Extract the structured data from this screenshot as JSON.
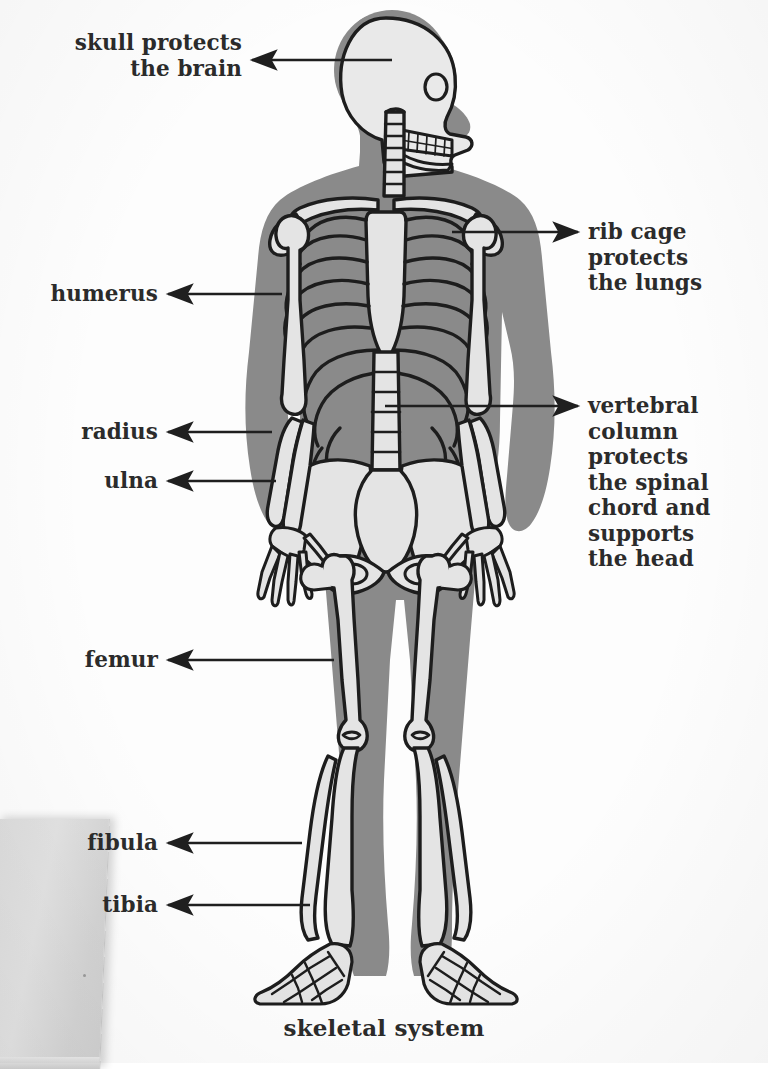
{
  "caption": "skeletal system",
  "colors": {
    "body_silhouette": "#8a8a8a",
    "bone_fill": "#dcdcdc",
    "bone_fill_light": "#e9e9e9",
    "outline": "#1d1d1d",
    "text": "#2b2b2b",
    "page_background": "#fdfdfd",
    "book_edge": "#dcdcdc"
  },
  "diagram": {
    "title": "skeletal system",
    "labels": [
      {
        "id": "skull",
        "text": "skull protects\nthe brain",
        "side": "left",
        "lines": 2,
        "arrow_from_x": 392,
        "arrow_from_y": 60,
        "arrow_to_x": 252,
        "arrow_to_y": 60
      },
      {
        "id": "humerus",
        "text": "humerus",
        "side": "left",
        "lines": 1,
        "arrow_from_x": 282,
        "arrow_from_y": 294,
        "arrow_to_x": 168,
        "arrow_to_y": 294
      },
      {
        "id": "radius",
        "text": "radius",
        "side": "left",
        "lines": 1,
        "arrow_from_x": 272,
        "arrow_from_y": 432,
        "arrow_to_x": 168,
        "arrow_to_y": 432
      },
      {
        "id": "ulna",
        "text": "ulna",
        "side": "left",
        "lines": 1,
        "arrow_from_x": 276,
        "arrow_from_y": 481,
        "arrow_to_x": 168,
        "arrow_to_y": 481
      },
      {
        "id": "femur",
        "text": "femur",
        "side": "left",
        "lines": 1,
        "arrow_from_x": 334,
        "arrow_from_y": 660,
        "arrow_to_x": 168,
        "arrow_to_y": 660
      },
      {
        "id": "fibula",
        "text": "fibula",
        "side": "left",
        "lines": 1,
        "arrow_from_x": 302,
        "arrow_from_y": 843,
        "arrow_to_x": 168,
        "arrow_to_y": 843
      },
      {
        "id": "tibia",
        "text": "tibia",
        "side": "left",
        "lines": 1,
        "arrow_from_x": 310,
        "arrow_from_y": 905,
        "arrow_to_x": 168,
        "arrow_to_y": 905
      },
      {
        "id": "ribcage",
        "text": "rib cage\nprotects\nthe lungs",
        "side": "right",
        "lines": 3,
        "arrow_from_x": 452,
        "arrow_from_y": 232,
        "arrow_to_x": 578,
        "arrow_to_y": 232
      },
      {
        "id": "vertebral",
        "text": "vertebral\ncolumn\nprotects\nthe spinal\nchord and\nsupports\nthe head",
        "side": "right",
        "lines": 7,
        "arrow_from_x": 385,
        "arrow_from_y": 406,
        "arrow_to_x": 578,
        "arrow_to_y": 406
      }
    ],
    "bone_groups": [
      "skull",
      "mandible",
      "cervical vertebrae",
      "clavicle",
      "scapula",
      "sternum",
      "ribs",
      "thoracic vertebrae",
      "lumbar vertebrae",
      "pelvis",
      "sacrum",
      "humerus",
      "radius",
      "ulna",
      "carpals",
      "metacarpals",
      "phalanges",
      "femur",
      "patella",
      "tibia",
      "fibula",
      "tarsals",
      "metatarsals",
      "foot phalanges"
    ],
    "rib_pairs": 10
  },
  "label_positions": {
    "skull": {
      "x": 30,
      "y": 30,
      "w": 212
    },
    "humerus": {
      "x": 10,
      "y": 281,
      "w": 148
    },
    "radius": {
      "x": 10,
      "y": 419,
      "w": 148
    },
    "ulna": {
      "x": 10,
      "y": 468,
      "w": 148
    },
    "femur": {
      "x": 10,
      "y": 647,
      "w": 148
    },
    "fibula": {
      "x": 10,
      "y": 830,
      "w": 148
    },
    "tibia": {
      "x": 10,
      "y": 892,
      "w": 148
    },
    "ribcage": {
      "x": 588,
      "y": 219,
      "w": 176
    },
    "vertebral": {
      "x": 588,
      "y": 393,
      "w": 176
    }
  }
}
